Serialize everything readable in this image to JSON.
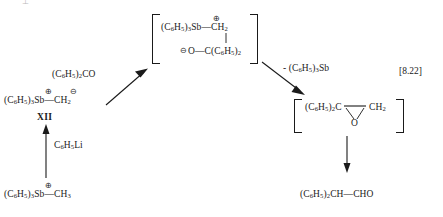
{
  "scheme": {
    "equation_number": "[8.22]",
    "top_artifact": "⊥"
  },
  "reactants": {
    "stibonium_salt": {
      "name": "methyltriphenylstibonium-cation",
      "left": "(C",
      "left_sub": "6",
      "left_mid": "H",
      "left_sub2": "5",
      "left_close": ")",
      "left_sub3": "3",
      "center": "Sb",
      "charge": "⊕",
      "bond": "—",
      "right": "CH",
      "right_sub": "3"
    },
    "ylide_label": "XII",
    "ylide": {
      "name": "triphenylstibonium-methylide",
      "plus_charge": "⊕",
      "minus_charge": "⊖",
      "text_a": "(C",
      "sub_a": "6",
      "text_b": "H",
      "sub_b": "5",
      "text_c": ")",
      "sub_c": "3",
      "text_d": "Sb",
      "bond": "—",
      "text_e": "CH",
      "sub_e": "2"
    },
    "lithium_reagent": {
      "text_a": "C",
      "sub_a": "6",
      "text_b": "H",
      "sub_b": "5",
      "text_c": "Li"
    },
    "benzophenone": {
      "text_a": "(C",
      "sub_a": "6",
      "text_b": "H",
      "sub_b": "5",
      "text_c": ")",
      "sub_c": "2",
      "text_d": "CO"
    }
  },
  "intermediate_betaine": {
    "name": "betaine-intermediate",
    "top_charge": "⊕",
    "bottom_charge": "⊖",
    "top_left_a": "(C",
    "top_left_sub_a": "6",
    "top_left_b": "H",
    "top_left_sub_b": "5",
    "top_left_c": ")",
    "top_left_sub_c": "3",
    "top_left_d": "Sb",
    "top_bond": "—",
    "top_right": "CH",
    "top_right_sub": "2",
    "bottom_o": "O",
    "bottom_bond": "—",
    "bottom_c": "C(C",
    "bottom_sub_a": "6",
    "bottom_h": "H",
    "bottom_sub_b": "5",
    "bottom_close": ")",
    "bottom_sub_c": "2"
  },
  "elimination_label": {
    "minus": "-",
    "text_a": "(C",
    "sub_a": "6",
    "text_b": "H",
    "sub_b": "5",
    "text_c": ")",
    "sub_c": "3",
    "text_d": "Sb"
  },
  "intermediate_epoxide": {
    "name": "epoxide-intermediate",
    "left_a": "(C",
    "left_sub_a": "6",
    "left_b": "H",
    "left_sub_b": "5",
    "left_c": ")",
    "left_sub_c": "2",
    "left_d": "C",
    "right": "CH",
    "right_sub": "2",
    "oxygen": "O"
  },
  "product": {
    "name": "diphenylacetaldehyde",
    "text_a": "(C",
    "sub_a": "6",
    "text_b": "H",
    "sub_b": "5",
    "text_c": ")",
    "sub_c": "2",
    "text_d": "CH",
    "bond": "—",
    "text_e": "CHO"
  }
}
